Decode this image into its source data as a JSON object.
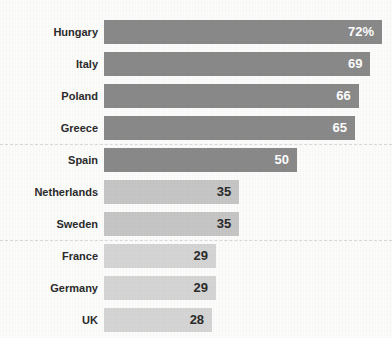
{
  "chart_data": {
    "type": "bar",
    "orientation": "horizontal",
    "title": "",
    "xlabel": "",
    "ylabel": "",
    "grid": false,
    "legend": null,
    "xlim": [
      0,
      72
    ],
    "value_suffix_first": "%",
    "categories": [
      "Hungary",
      "Italy",
      "Poland",
      "Greece",
      "Spain",
      "Netherlands",
      "Sweden",
      "France",
      "Germany",
      "UK"
    ],
    "values": [
      72,
      69,
      66,
      65,
      50,
      35,
      35,
      29,
      29,
      28
    ],
    "value_labels": [
      "72%",
      "69",
      "66",
      "65",
      "50",
      "35",
      "35",
      "29",
      "29",
      "28"
    ],
    "bars": [
      {
        "category": "Hungary",
        "value": 72,
        "label": "72%",
        "tier": "dark",
        "label_color": "light"
      },
      {
        "category": "Italy",
        "value": 69,
        "label": "69",
        "tier": "dark",
        "label_color": "light"
      },
      {
        "category": "Poland",
        "value": 66,
        "label": "66",
        "tier": "dark",
        "label_color": "light"
      },
      {
        "category": "Greece",
        "value": 65,
        "label": "65",
        "tier": "dark",
        "label_color": "light"
      },
      {
        "category": "Spain",
        "value": 50,
        "label": "50",
        "tier": "dark",
        "label_color": "light"
      },
      {
        "category": "Netherlands",
        "value": 35,
        "label": "35",
        "tier": "mid",
        "label_color": "dark"
      },
      {
        "category": "Sweden",
        "value": 35,
        "label": "35",
        "tier": "mid",
        "label_color": "dark"
      },
      {
        "category": "France",
        "value": 29,
        "label": "29",
        "tier": "light",
        "label_color": "dark"
      },
      {
        "category": "Germany",
        "value": 29,
        "label": "29",
        "tier": "light",
        "label_color": "dark"
      },
      {
        "category": "UK",
        "value": 28,
        "label": "28",
        "tier": "light",
        "label_color": "dark"
      }
    ],
    "group_dividers_after": [
      "Greece",
      "Sweden"
    ],
    "colors": {
      "background": "#fdfdfc",
      "bar_dark": "#8a8a8a",
      "bar_mid": "#c7c7c7",
      "bar_light": "#d6d6d6",
      "label_text": "#2b2b2b",
      "value_text_on_dark": "#ffffff",
      "value_text_on_light": "#2b2b2b",
      "divider": "#d8d8d8"
    }
  }
}
